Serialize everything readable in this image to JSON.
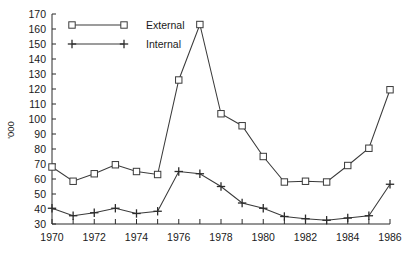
{
  "chart_data": {
    "type": "line",
    "title": "",
    "xlabel": "",
    "ylabel": "'000",
    "x": [
      1970,
      1971,
      1972,
      1973,
      1974,
      1975,
      1976,
      1977,
      1978,
      1979,
      1980,
      1981,
      1982,
      1983,
      1984,
      1985,
      1986
    ],
    "xlim": [
      1970,
      1986
    ],
    "ylim": [
      30,
      170
    ],
    "y_ticks": [
      30,
      40,
      50,
      60,
      70,
      80,
      90,
      100,
      110,
      120,
      130,
      140,
      150,
      160,
      170
    ],
    "y_tick_labels": [
      "30",
      "40",
      "50",
      "60",
      "70",
      "80",
      "90",
      "100",
      "110",
      "120",
      "130",
      "140",
      "150",
      "160",
      "170"
    ],
    "x_ticks": [
      1970,
      1971,
      1972,
      1973,
      1974,
      1975,
      1976,
      1977,
      1978,
      1979,
      1980,
      1981,
      1982,
      1983,
      1984,
      1985,
      1986
    ],
    "x_tick_labels_shown": [
      "1970",
      "1972",
      "1974",
      "1976",
      "1978",
      "1980",
      "1982",
      "1984",
      "1986"
    ],
    "x_tick_labels_shown_values": [
      1970,
      1972,
      1974,
      1976,
      1978,
      1980,
      1982,
      1984,
      1986
    ],
    "grid": false,
    "legend_position": "top-left-inside",
    "series": [
      {
        "name": "External",
        "marker": "open-square",
        "color": "#3a3a3a",
        "values": [
          68,
          58.5,
          63.5,
          69.5,
          65,
          63,
          126,
          163,
          103.5,
          95.5,
          75,
          58,
          58.5,
          58,
          69,
          80.5,
          119.5
        ]
      },
      {
        "name": "Internal",
        "marker": "plus",
        "color": "#2b2b2b",
        "values": [
          40.5,
          35.5,
          37.5,
          40.5,
          37,
          38.5,
          65,
          63.5,
          55,
          44,
          40.5,
          35,
          33.5,
          32.5,
          34,
          35.5,
          56.5
        ]
      }
    ]
  },
  "legend": {
    "entries": [
      {
        "label": "External"
      },
      {
        "label": "Internal"
      }
    ]
  }
}
